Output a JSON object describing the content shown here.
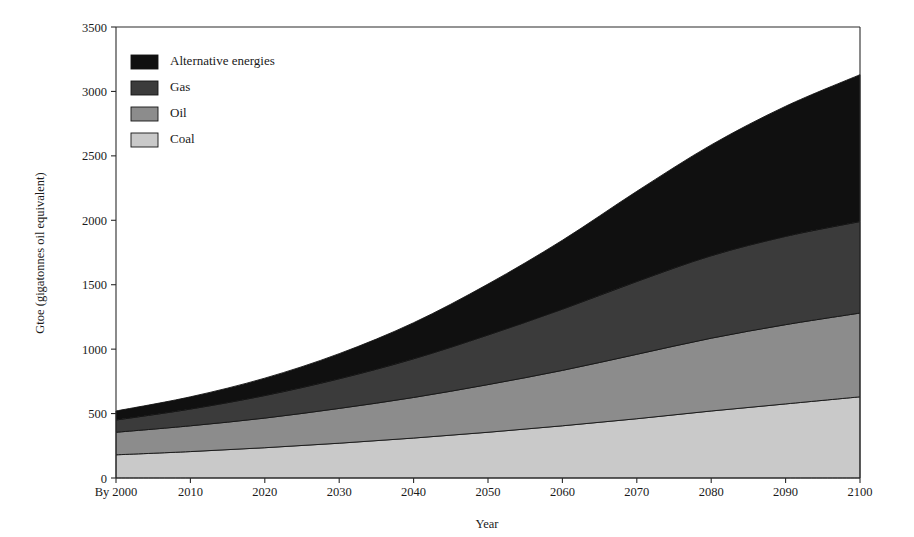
{
  "chart_data": {
    "type": "area",
    "stacked": true,
    "title": "",
    "subtitle": "",
    "xlabel": "Year",
    "ylabel": "Gtoe (gigatonnes oil equivalent)",
    "x": [
      2000,
      2010,
      2020,
      2030,
      2040,
      2050,
      2060,
      2070,
      2080,
      2090,
      2100
    ],
    "x_tick_labels": [
      "By 2000",
      "2010",
      "2020",
      "2030",
      "2040",
      "2050",
      "2060",
      "2070",
      "2080",
      "2090",
      "2100"
    ],
    "xlim": [
      2000,
      2100
    ],
    "ylim": [
      0,
      3500
    ],
    "y_ticks": [
      0,
      500,
      1000,
      1500,
      2000,
      2500,
      3000,
      3500
    ],
    "y_tick_labels": [
      "0",
      "500",
      "1000",
      "1500",
      "2000",
      "2500",
      "3000",
      "3500"
    ],
    "grid": false,
    "legend_position": "top-left inside plot",
    "stack_order_bottom_to_top": [
      "Coal",
      "Oil",
      "Gas",
      "Alternative energies"
    ],
    "legend_order_top_to_bottom": [
      "Alternative energies",
      "Gas",
      "Oil",
      "Coal"
    ],
    "series": [
      {
        "name": "Coal",
        "color": "#c9c9c9",
        "values": [
          180,
          205,
          235,
          270,
          310,
          355,
          405,
          460,
          520,
          575,
          630
        ]
      },
      {
        "name": "Oil",
        "color": "#8c8c8c",
        "values": [
          175,
          200,
          230,
          270,
          315,
          370,
          430,
          500,
          565,
          615,
          650
        ]
      },
      {
        "name": "Gas",
        "color": "#3b3b3b",
        "values": [
          95,
          130,
          175,
          230,
          300,
          385,
          475,
          565,
          640,
          685,
          710
        ]
      },
      {
        "name": "Alternative energies",
        "color": "#101010",
        "values": [
          70,
          95,
          135,
          195,
          280,
          395,
          535,
          700,
          860,
          1010,
          1140
        ]
      }
    ],
    "cumulative_totals": [
      520,
      630,
      775,
      965,
      1205,
      1505,
      1845,
      2225,
      2585,
      2885,
      3130
    ],
    "cumulative_boundaries": {
      "coal_top": [
        180,
        205,
        235,
        270,
        310,
        355,
        405,
        460,
        520,
        575,
        630
      ],
      "oil_top": [
        355,
        405,
        465,
        540,
        625,
        725,
        835,
        960,
        1085,
        1190,
        1280
      ],
      "gas_top": [
        450,
        535,
        640,
        770,
        925,
        1110,
        1310,
        1525,
        1725,
        1875,
        1990
      ],
      "alternative_top": [
        520,
        630,
        775,
        965,
        1205,
        1505,
        1845,
        2225,
        2585,
        2885,
        3130
      ]
    }
  },
  "legend": {
    "items": [
      {
        "label": "Alternative energies",
        "color": "#101010"
      },
      {
        "label": "Gas",
        "color": "#3b3b3b"
      },
      {
        "label": "Oil",
        "color": "#8c8c8c"
      },
      {
        "label": "Coal",
        "color": "#c9c9c9"
      }
    ]
  },
  "axes": {
    "x_title": "Year",
    "y_title": "Gtoe (gigatonnes oil equivalent)"
  }
}
